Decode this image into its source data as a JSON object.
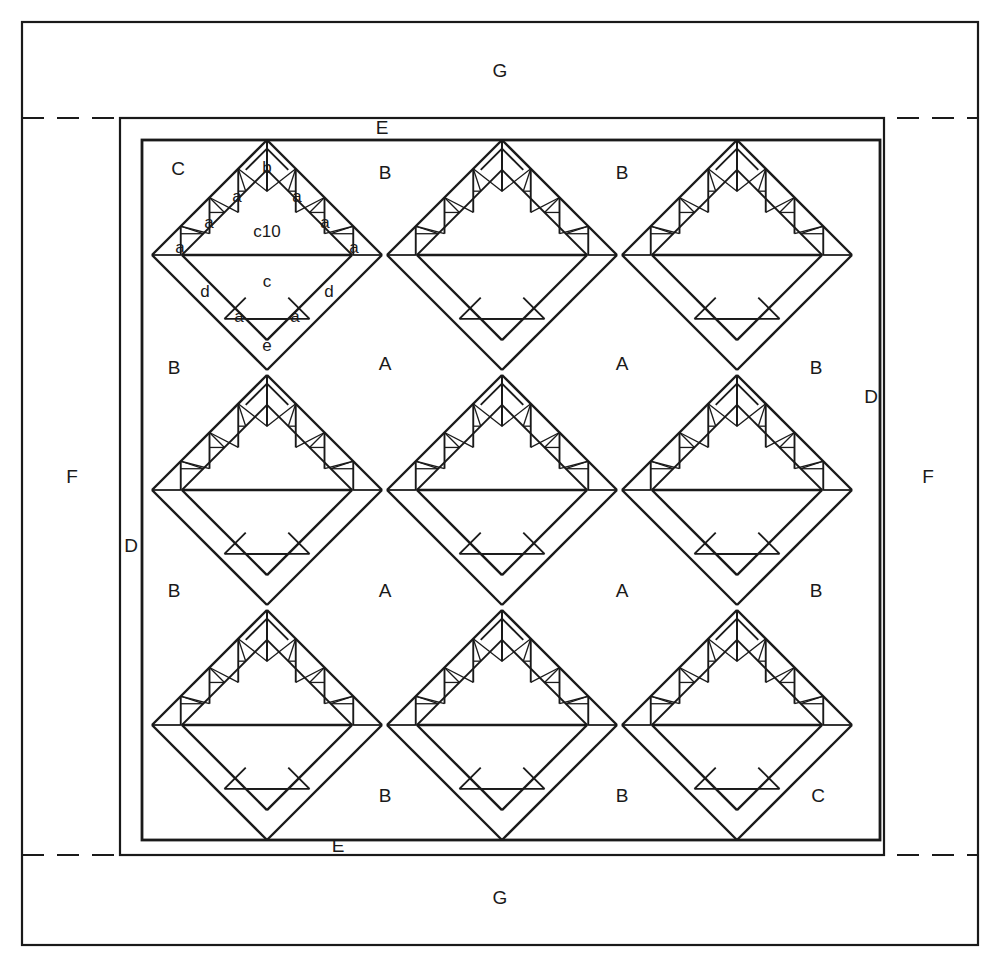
{
  "diagram": {
    "type": "patchwork-piecing-diagram",
    "colors": {
      "line": "#1a1a1a",
      "background": "#ffffff",
      "label": "#1a1a1a"
    },
    "canvas": {
      "width": 999,
      "height": 966
    },
    "frames": {
      "outer_border": {
        "label": "G",
        "x": 22,
        "y": 22,
        "width": 956,
        "height": 923,
        "stroke": 2
      },
      "side_border": {
        "label": "F",
        "stroke": 2
      },
      "sashing_band": {
        "label": "E",
        "x": 120,
        "y": 118,
        "width": 764,
        "height": 737,
        "stroke": 2
      },
      "inner_band": {
        "label": "D",
        "x": 142,
        "y": 140,
        "width": 738,
        "height": 700,
        "stroke": 2.6
      },
      "dashed_guides": [
        {
          "name": "top-guide",
          "y": 118
        },
        {
          "name": "bottom-guide",
          "y": 855
        }
      ]
    },
    "border_labels": [
      {
        "id": "G-top",
        "text": "G",
        "x": 500,
        "y": 72
      },
      {
        "id": "G-bottom",
        "text": "G",
        "x": 500,
        "y": 899
      },
      {
        "id": "F-left",
        "text": "F",
        "x": 72,
        "y": 478
      },
      {
        "id": "F-right",
        "text": "F",
        "x": 928,
        "y": 478
      },
      {
        "id": "E-top",
        "text": "E",
        "x": 382,
        "y": 129
      },
      {
        "id": "E-bottom",
        "text": "E",
        "x": 338,
        "y": 847
      },
      {
        "id": "D-right",
        "text": "D",
        "x": 871,
        "y": 398
      },
      {
        "id": "D-left",
        "text": "D",
        "x": 131,
        "y": 547
      }
    ],
    "field_labels": [
      {
        "id": "C-tl",
        "text": "C",
        "x": 178,
        "y": 170
      },
      {
        "id": "B-t1",
        "text": "B",
        "x": 385,
        "y": 174
      },
      {
        "id": "B-t2",
        "text": "B",
        "x": 622,
        "y": 174
      },
      {
        "id": "B-l1",
        "text": "B",
        "x": 174,
        "y": 369
      },
      {
        "id": "A-1",
        "text": "A",
        "x": 385,
        "y": 365
      },
      {
        "id": "A-2",
        "text": "A",
        "x": 622,
        "y": 365
      },
      {
        "id": "B-r1",
        "text": "B",
        "x": 816,
        "y": 369
      },
      {
        "id": "B-l2",
        "text": "B",
        "x": 174,
        "y": 592
      },
      {
        "id": "A-3",
        "text": "A",
        "x": 385,
        "y": 592
      },
      {
        "id": "A-4",
        "text": "A",
        "x": 622,
        "y": 592
      },
      {
        "id": "B-r2",
        "text": "B",
        "x": 816,
        "y": 592
      },
      {
        "id": "B-b1",
        "text": "B",
        "x": 385,
        "y": 797
      },
      {
        "id": "B-b2",
        "text": "B",
        "x": 622,
        "y": 797
      },
      {
        "id": "C-br",
        "text": "C",
        "x": 818,
        "y": 797
      }
    ],
    "motif": {
      "name": "basket-block",
      "grid": {
        "columns": 3,
        "rows": 3,
        "spacing": 235,
        "origin_x": 267,
        "origin_y": 255
      },
      "half_diagonal": 115,
      "piece_labels": [
        {
          "id": "b",
          "text": "b",
          "dx": 0,
          "dy": -86
        },
        {
          "id": "c10",
          "text": "c10",
          "dx": 0,
          "dy": -22
        },
        {
          "id": "c",
          "text": "c",
          "dx": 0,
          "dy": 28
        },
        {
          "id": "e",
          "text": "e",
          "dx": 0,
          "dy": 92
        },
        {
          "id": "d-l",
          "text": "d",
          "dx": -62,
          "dy": 38
        },
        {
          "id": "d-r",
          "text": "d",
          "dx": 62,
          "dy": 38
        },
        {
          "id": "a1",
          "text": "a",
          "dx": -30,
          "dy": -57
        },
        {
          "id": "a2",
          "text": "a",
          "dx": 30,
          "dy": -57
        },
        {
          "id": "a3",
          "text": "a",
          "dx": -58,
          "dy": -31
        },
        {
          "id": "a4",
          "text": "a",
          "dx": 58,
          "dy": -31
        },
        {
          "id": "a5",
          "text": "a",
          "dx": -87,
          "dy": -6
        },
        {
          "id": "a6",
          "text": "a",
          "dx": 87,
          "dy": -6
        },
        {
          "id": "a7",
          "text": "a",
          "dx": -28,
          "dy": 63
        },
        {
          "id": "a8",
          "text": "a",
          "dx": 28,
          "dy": 63
        }
      ],
      "labeled_instance_index": 0
    }
  }
}
